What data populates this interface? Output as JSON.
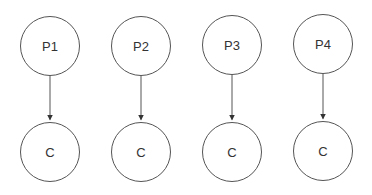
{
  "diagram": {
    "stroke_color": "#555555",
    "background": "#ffffff",
    "nodes": [
      {
        "id": "p1",
        "label": "P1",
        "cx": 50,
        "cy": 46,
        "r": 29.5
      },
      {
        "id": "p2",
        "label": "P2",
        "cx": 141,
        "cy": 46,
        "r": 29.5
      },
      {
        "id": "p3",
        "label": "P3",
        "cx": 232,
        "cy": 45,
        "r": 29.5
      },
      {
        "id": "p4",
        "label": "P4",
        "cx": 323,
        "cy": 44,
        "r": 29.5
      },
      {
        "id": "c1",
        "label": "C",
        "cx": 50,
        "cy": 152,
        "r": 29.5
      },
      {
        "id": "c2",
        "label": "C",
        "cx": 141,
        "cy": 152,
        "r": 29.5
      },
      {
        "id": "c3",
        "label": "C",
        "cx": 232,
        "cy": 152,
        "r": 29.5
      },
      {
        "id": "c4",
        "label": "C",
        "cx": 323,
        "cy": 151,
        "r": 29.5
      }
    ],
    "edges": [
      {
        "from": "p1",
        "to": "c1"
      },
      {
        "from": "p2",
        "to": "c2"
      },
      {
        "from": "p3",
        "to": "c3"
      },
      {
        "from": "p4",
        "to": "c4"
      }
    ]
  }
}
